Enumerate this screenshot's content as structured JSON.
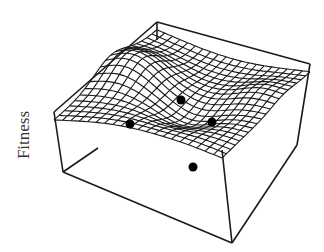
{
  "figure": {
    "axis_label": "Fitness",
    "colors": {
      "line": "#1a1a1a",
      "background": "#ffffff",
      "point": "#000000"
    }
  },
  "box": {
    "top": [
      [
        54,
        112
      ],
      [
        157,
        22
      ],
      [
        310,
        64
      ],
      [
        222,
        150
      ]
    ],
    "bottom_visible": [
      [
        63,
        172
      ],
      [
        232,
        243
      ],
      [
        297,
        145
      ]
    ]
  },
  "surface": {
    "grid_u": 20,
    "grid_v": 20
  },
  "points": [
    {
      "label": "point-1",
      "x": 181,
      "y": 100
    },
    {
      "label": "point-2",
      "x": 130,
      "y": 124
    },
    {
      "label": "point-3",
      "x": 212,
      "y": 122
    },
    {
      "label": "point-4",
      "x": 193,
      "y": 167
    }
  ]
}
